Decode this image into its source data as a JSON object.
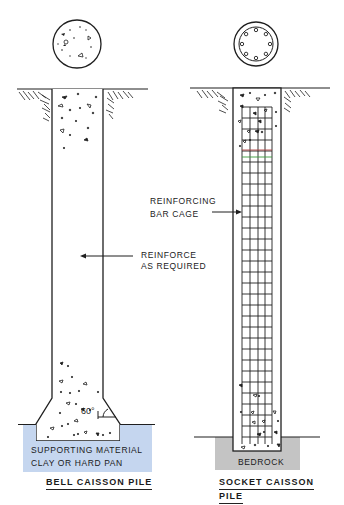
{
  "colors": {
    "ink": "#1f1f1f",
    "supporting_material_fill": "#c5d6ef",
    "bedrock_fill": "#c4c4c4",
    "background": "#ffffff"
  },
  "bell_pile": {
    "caption": "BELL CAISSON PILE",
    "section_view": "plain-concrete-circle",
    "annotation": {
      "line1": "REINFORCE",
      "line2": "AS REQUIRED"
    },
    "angle_label": "60°",
    "base_material": {
      "line1": "SUPPORTING MATERIAL",
      "line2": "CLAY OR HARD PAN"
    }
  },
  "socket_pile": {
    "caption_line1": "SOCKET CAISSON",
    "caption_line2": "PILE",
    "section_view": "reinforced-circle-with-8-bars",
    "annotation": {
      "line1": "REINFORCING",
      "line2": "BAR CAGE"
    },
    "base_material": {
      "label": "BEDROCK"
    }
  }
}
